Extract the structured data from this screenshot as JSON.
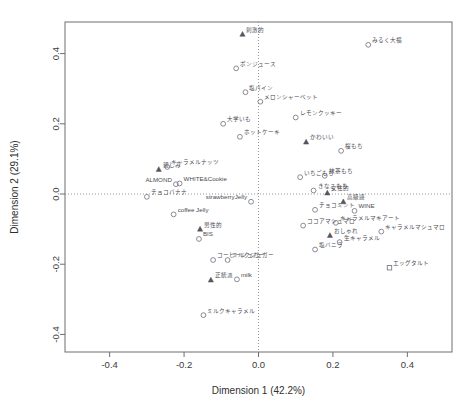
{
  "chart_data": {
    "type": "scatter",
    "title": "",
    "xlabel": "Dimension 1 (42.2%)",
    "ylabel": "Dimension 2 (29.1%)",
    "xlim": [
      -0.52,
      0.52
    ],
    "ylim": [
      -0.45,
      0.49
    ],
    "xticks": [
      "-0.4",
      "-0.2",
      "0.0",
      "0.2",
      "0.4"
    ],
    "xtickvals": [
      -0.4,
      -0.2,
      0.0,
      0.2,
      0.4
    ],
    "yticks": [
      "-0.4",
      "-0.2",
      "0.0",
      "0.2",
      "0.4"
    ],
    "ytickvals": [
      -0.4,
      -0.2,
      0.0,
      0.2,
      0.4
    ],
    "grid": false,
    "legend": "none",
    "reference_lines": {
      "x": 0.0,
      "y": 0.0,
      "style": "dotted"
    },
    "series": [
      {
        "name": "products",
        "marker": "circle",
        "points": [
          {
            "label": "みるく大福",
            "x": 0.295,
            "y": 0.425,
            "label_pos": "right"
          },
          {
            "label": "ポンジュース",
            "x": -0.06,
            "y": 0.358,
            "label_pos": "right"
          },
          {
            "label": "塩パイン",
            "x": -0.035,
            "y": 0.29,
            "label_pos": "right"
          },
          {
            "label": "メロンシャーベット",
            "x": 0.005,
            "y": 0.263,
            "label_pos": "right"
          },
          {
            "label": "レモンクッキー",
            "x": 0.1,
            "y": 0.218,
            "label_pos": "right"
          },
          {
            "label": "大学いも",
            "x": -0.095,
            "y": 0.2,
            "label_pos": "right"
          },
          {
            "label": "ホットケーキ",
            "x": -0.05,
            "y": 0.163,
            "label_pos": "right"
          },
          {
            "label": "桜もち",
            "x": 0.222,
            "y": 0.123,
            "label_pos": "right"
          },
          {
            "label": "キャラメルナッツ",
            "x": -0.245,
            "y": 0.077,
            "label_pos": "right"
          },
          {
            "label": "抹茶もち",
            "x": 0.178,
            "y": 0.052,
            "label_pos": "right"
          },
          {
            "label": "いちごもち",
            "x": 0.112,
            "y": 0.048,
            "label_pos": "right"
          },
          {
            "label": "WHITE&Cookie",
            "x": -0.212,
            "y": 0.03,
            "label_pos": "right"
          },
          {
            "label": "ALMOND",
            "x": -0.222,
            "y": 0.028,
            "label_pos": "left"
          },
          {
            "label": "きなこもち",
            "x": 0.148,
            "y": 0.01,
            "label_pos": "right"
          },
          {
            "label": "チョコバナナ",
            "x": -0.3,
            "y": -0.008,
            "label_pos": "right"
          },
          {
            "label": "strawberryJelly",
            "x": -0.02,
            "y": -0.022,
            "label_pos": "left"
          },
          {
            "label": "チョコミント",
            "x": 0.152,
            "y": -0.045,
            "label_pos": "right"
          },
          {
            "label": "WINE",
            "x": 0.258,
            "y": -0.048,
            "label_pos": "right"
          },
          {
            "label": "coffee Jelly",
            "x": -0.228,
            "y": -0.058,
            "label_pos": "right"
          },
          {
            "label": "キャラメルマキアート",
            "x": 0.208,
            "y": -0.082,
            "label_pos": "right"
          },
          {
            "label": "ココアマシュマロ",
            "x": 0.12,
            "y": -0.09,
            "label_pos": "right"
          },
          {
            "label": "キャラメルマシュマロ",
            "x": 0.33,
            "y": -0.107,
            "label_pos": "right"
          },
          {
            "label": "BIS",
            "x": -0.16,
            "y": -0.128,
            "label_pos": "right"
          },
          {
            "label": "生キャラメル",
            "x": 0.218,
            "y": -0.137,
            "label_pos": "right"
          },
          {
            "label": "塩バニラ",
            "x": 0.152,
            "y": -0.158,
            "label_pos": "right"
          },
          {
            "label": "コーヒーシュガー",
            "x": -0.122,
            "y": -0.188,
            "label_pos": "right"
          },
          {
            "label": "ミルクシュガー",
            "x": -0.083,
            "y": -0.188,
            "label_pos": "right"
          },
          {
            "label": "milk",
            "x": -0.058,
            "y": -0.243,
            "label_pos": "right"
          },
          {
            "label": "ミルクキャラメル",
            "x": -0.148,
            "y": -0.345,
            "label_pos": "right"
          }
        ]
      },
      {
        "name": "products-square",
        "marker": "square",
        "points": [
          {
            "label": "エッグタルト",
            "x": 0.352,
            "y": -0.21,
            "label_pos": "right"
          }
        ]
      },
      {
        "name": "attributes",
        "marker": "triangle",
        "points": [
          {
            "label": "刺激的",
            "x": -0.043,
            "y": 0.455,
            "label_pos": "right"
          },
          {
            "label": "かわいい",
            "x": 0.128,
            "y": 0.148,
            "label_pos": "right"
          },
          {
            "label": "親しみ",
            "x": -0.268,
            "y": 0.07,
            "label_pos": "right"
          },
          {
            "label": "女性的",
            "x": 0.185,
            "y": 0.003,
            "label_pos": "right"
          },
          {
            "label": "高級感",
            "x": 0.228,
            "y": -0.022,
            "label_pos": "right"
          },
          {
            "label": "男性的",
            "x": -0.157,
            "y": -0.1,
            "label_pos": "right"
          },
          {
            "label": "おしゃれ",
            "x": 0.192,
            "y": -0.118,
            "label_pos": "right"
          },
          {
            "label": "正統派",
            "x": -0.128,
            "y": -0.245,
            "label_pos": "right"
          }
        ]
      }
    ]
  },
  "plot_box": {
    "left": 65,
    "top": 22,
    "right": 452,
    "bottom": 352
  },
  "colors": {
    "background": "#ffffff",
    "axis": "#6e6e6e",
    "point_stroke": "#7d7d8c",
    "triangle_fill": "#555560",
    "text": "#3a3a3a",
    "reference_line": "#8a8a8a"
  }
}
